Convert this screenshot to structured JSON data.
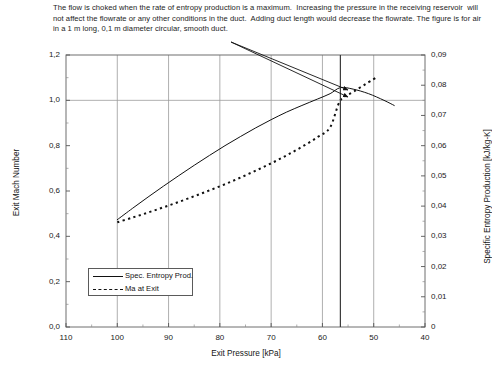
{
  "caption": {
    "text": "The flow is choked when the rate of entropy production is a maximum.  Increasing the pressure in the receiving reservoir  will not affect the flowrate or any other conditions in the duct.  Adding duct length would decrease the flowrate. The figure is for air in a 1 m long, 0,1 m diameter circular, smooth duct."
  },
  "chart_data": {
    "type": "line",
    "title": "",
    "xlabel": "Exit Pressure [kPa]",
    "ylabel": "Exit Mach Number",
    "y2label": "Specific Entropy Production [kJ/kg-K]",
    "xlim": [
      110,
      40
    ],
    "x_inverted": true,
    "ylim": [
      0.0,
      1.2
    ],
    "y2lim": [
      0,
      0.09
    ],
    "grid": true,
    "legend_position": "lower-left-inside",
    "xticks": [
      "110",
      "100",
      "90",
      "80",
      "70",
      "60",
      "50",
      "40"
    ],
    "xtick_values": [
      110,
      100,
      90,
      80,
      70,
      60,
      50,
      40
    ],
    "yticks": [
      "0,0",
      "0,2",
      "0,4",
      "0,6",
      "0,8",
      "1,0",
      "1,2"
    ],
    "ytick_values": [
      0.0,
      0.2,
      0.4,
      0.6,
      0.8,
      1.0,
      1.2
    ],
    "y2ticks": [
      "0",
      "0,01",
      "0,02",
      "0,03",
      "0,04",
      "0,05",
      "0,06",
      "0,07",
      "0,08",
      "0,09"
    ],
    "y2tick_values": [
      0,
      0.01,
      0.02,
      0.03,
      0.04,
      0.05,
      0.06,
      0.07,
      0.08,
      0.09
    ],
    "choke_pressure": 56.5,
    "choke_mach": 1.0,
    "choke_entropy": 0.0792,
    "series": [
      {
        "name": "Spec. Entropy Prod.",
        "axis": "y2",
        "style": "solid",
        "x": [
          100,
          97,
          94,
          91,
          88,
          85,
          82,
          79,
          76,
          73,
          70,
          67,
          64,
          61,
          58.5,
          56.5,
          54,
          51,
          48,
          46
        ],
        "values": [
          0.0355,
          0.0393,
          0.043,
          0.0466,
          0.0501,
          0.0535,
          0.0568,
          0.06,
          0.063,
          0.0659,
          0.0686,
          0.0711,
          0.0733,
          0.0754,
          0.0772,
          0.0792,
          0.0787,
          0.0772,
          0.075,
          0.0733
        ]
      },
      {
        "name": "Ma at Exit",
        "axis": "y1",
        "style": "dashed",
        "x": [
          100,
          97,
          94,
          91,
          88,
          85,
          82,
          79,
          76,
          73,
          70,
          67,
          64,
          61,
          58.5,
          56.5,
          54,
          51,
          49.5
        ],
        "values": [
          0.462,
          0.483,
          0.505,
          0.528,
          0.552,
          0.577,
          0.603,
          0.63,
          0.659,
          0.69,
          0.722,
          0.757,
          0.795,
          0.837,
          0.881,
          1.0,
          1.037,
          1.08,
          1.1
        ]
      }
    ],
    "annotations": [
      {
        "name": "choke-leader-upper",
        "from": [
          231,
          42
        ],
        "to": [
          348,
          90
        ]
      },
      {
        "name": "choke-leader-lower",
        "from": [
          231,
          42
        ],
        "to": [
          348,
          97
        ]
      },
      {
        "name": "choke-vertical-line",
        "x": 56.5
      }
    ]
  },
  "legend": {
    "items": [
      {
        "label": "Spec. Entropy Prod.",
        "style": "solid"
      },
      {
        "label": "Ma at Exit",
        "style": "dashed"
      }
    ]
  }
}
